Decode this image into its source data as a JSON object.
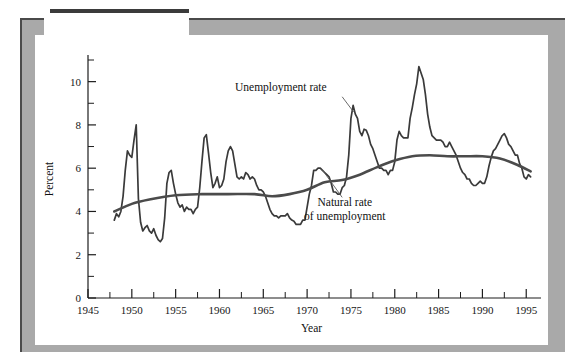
{
  "figure": {
    "label_prefix": "Figure ",
    "label_number": "5-1"
  },
  "chart_data": {
    "type": "line",
    "title": "",
    "xlabel": "Year",
    "ylabel": "Percent",
    "xlim": [
      1945,
      1996
    ],
    "ylim": [
      0,
      11
    ],
    "xticks": [
      1945,
      1950,
      1955,
      1960,
      1965,
      1970,
      1975,
      1980,
      1985,
      1990,
      1995
    ],
    "xtick_labels": [
      "1945",
      "1950",
      "1955",
      "1960",
      "1965",
      "1970",
      "1975",
      "1980",
      "1985",
      "1990",
      "1995"
    ],
    "x_minor_ticks": [
      1947.5,
      1952.5,
      1957.5,
      1962.5,
      1967.5,
      1972.5,
      1977.5,
      1982.5,
      1987.5,
      1992.5
    ],
    "yticks": [
      0,
      2,
      4,
      6,
      8,
      10
    ],
    "ytick_labels": [
      "0",
      "2",
      "4",
      "6",
      "8",
      "10"
    ],
    "y_minor_ticks": [
      1,
      3,
      5,
      7,
      9,
      11
    ],
    "grid": false,
    "legend_position": "annotations",
    "annotations": [
      {
        "name": "unemployment-rate",
        "text": "Unemployment rate",
        "text_x": 1967.0,
        "text_y": 9.55,
        "leader_from": [
          1974.0,
          9.3
        ],
        "leader_to": [
          1975.3,
          8.6
        ]
      },
      {
        "name": "natural-rate-of-unemployment",
        "text_line1": "Natural rate",
        "text_line2": "of unemployment",
        "text_x": 1974.3,
        "text_y": 4.25,
        "leader_from": [
          1974.0,
          4.65
        ],
        "leader_to": [
          1971.6,
          6.0
        ]
      }
    ],
    "series": [
      {
        "name": "Unemployment rate",
        "color": "#3a3a3a",
        "style": "jagged",
        "x": [
          1948.0,
          1948.25,
          1948.5,
          1948.75,
          1949.0,
          1949.25,
          1949.5,
          1949.75,
          1950.0,
          1950.25,
          1950.5,
          1950.75,
          1951.0,
          1951.25,
          1951.5,
          1951.75,
          1952.0,
          1952.25,
          1952.5,
          1952.75,
          1953.0,
          1953.25,
          1953.5,
          1953.75,
          1954.0,
          1954.25,
          1954.5,
          1954.75,
          1955.0,
          1955.25,
          1955.5,
          1955.75,
          1956.0,
          1956.25,
          1956.5,
          1956.75,
          1957.0,
          1957.25,
          1957.5,
          1957.75,
          1958.0,
          1958.25,
          1958.5,
          1958.75,
          1959.0,
          1959.25,
          1959.5,
          1959.75,
          1960.0,
          1960.25,
          1960.5,
          1960.75,
          1961.0,
          1961.25,
          1961.5,
          1961.75,
          1962.0,
          1962.25,
          1962.5,
          1962.75,
          1963.0,
          1963.25,
          1963.5,
          1963.75,
          1964.0,
          1964.25,
          1964.5,
          1964.75,
          1965.0,
          1965.25,
          1965.5,
          1965.75,
          1966.0,
          1966.25,
          1966.5,
          1966.75,
          1967.0,
          1967.25,
          1967.5,
          1967.75,
          1968.0,
          1968.25,
          1968.5,
          1968.75,
          1969.0,
          1969.25,
          1969.5,
          1969.75,
          1970.0,
          1970.25,
          1970.5,
          1970.75,
          1971.0,
          1971.25,
          1971.5,
          1971.75,
          1972.0,
          1972.25,
          1972.5,
          1972.75,
          1973.0,
          1973.25,
          1973.5,
          1973.75,
          1974.0,
          1974.25,
          1974.5,
          1974.75,
          1975.0,
          1975.25,
          1975.5,
          1975.75,
          1976.0,
          1976.25,
          1976.5,
          1976.75,
          1977.0,
          1977.25,
          1977.5,
          1977.75,
          1978.0,
          1978.25,
          1978.5,
          1978.75,
          1979.0,
          1979.25,
          1979.5,
          1979.75,
          1980.0,
          1980.25,
          1980.5,
          1980.75,
          1981.0,
          1981.25,
          1981.5,
          1981.75,
          1982.0,
          1982.25,
          1982.5,
          1982.75,
          1983.0,
          1983.25,
          1983.5,
          1983.75,
          1984.0,
          1984.25,
          1984.5,
          1984.75,
          1985.0,
          1985.25,
          1985.5,
          1985.75,
          1986.0,
          1986.25,
          1986.5,
          1986.75,
          1987.0,
          1987.25,
          1987.5,
          1987.75,
          1988.0,
          1988.25,
          1988.5,
          1988.75,
          1989.0,
          1989.25,
          1989.5,
          1989.75,
          1990.0,
          1990.25,
          1990.5,
          1990.75,
          1991.0,
          1991.25,
          1991.5,
          1991.75,
          1992.0,
          1992.25,
          1992.5,
          1992.75,
          1993.0,
          1993.25,
          1993.5,
          1993.75,
          1994.0,
          1994.25,
          1994.5,
          1994.75,
          1995.0,
          1995.25,
          1995.5
        ],
        "y": [
          3.6,
          3.9,
          3.75,
          4.0,
          4.7,
          5.9,
          6.8,
          6.6,
          6.5,
          7.3,
          8.0,
          4.6,
          3.5,
          3.1,
          3.25,
          3.35,
          3.1,
          3.0,
          3.2,
          2.9,
          2.7,
          2.6,
          2.75,
          3.7,
          5.3,
          5.8,
          5.9,
          5.3,
          4.8,
          4.4,
          4.2,
          4.3,
          4.0,
          4.2,
          4.1,
          4.1,
          3.9,
          4.1,
          4.2,
          5.1,
          6.3,
          7.4,
          7.55,
          6.7,
          5.8,
          5.1,
          5.3,
          5.6,
          5.1,
          5.2,
          5.5,
          6.3,
          6.8,
          7.0,
          6.8,
          6.2,
          5.6,
          5.5,
          5.6,
          5.5,
          5.8,
          5.7,
          5.5,
          5.6,
          5.5,
          5.2,
          5.0,
          5.0,
          4.9,
          4.7,
          4.4,
          4.1,
          3.9,
          3.8,
          3.8,
          3.7,
          3.8,
          3.8,
          3.8,
          3.9,
          3.7,
          3.6,
          3.55,
          3.4,
          3.4,
          3.4,
          3.6,
          3.6,
          4.2,
          4.8,
          5.2,
          5.9,
          5.9,
          6.0,
          6.0,
          5.9,
          5.8,
          5.7,
          5.6,
          5.3,
          4.9,
          4.9,
          4.8,
          4.8,
          5.1,
          5.2,
          5.6,
          6.6,
          8.3,
          8.9,
          8.5,
          8.3,
          7.7,
          7.5,
          7.8,
          7.75,
          7.5,
          7.1,
          6.9,
          6.6,
          6.3,
          6.0,
          6.0,
          5.9,
          5.9,
          5.7,
          5.9,
          5.9,
          6.3,
          7.3,
          7.7,
          7.5,
          7.4,
          7.4,
          7.4,
          8.3,
          8.8,
          9.4,
          9.9,
          10.7,
          10.4,
          10.1,
          9.4,
          8.5,
          7.9,
          7.5,
          7.4,
          7.3,
          7.3,
          7.3,
          7.2,
          7.0,
          7.0,
          7.2,
          7.0,
          6.8,
          6.6,
          6.3,
          6.0,
          5.8,
          5.7,
          5.5,
          5.5,
          5.3,
          5.2,
          5.2,
          5.3,
          5.4,
          5.3,
          5.3,
          5.6,
          6.1,
          6.5,
          6.8,
          6.9,
          7.1,
          7.3,
          7.5,
          7.6,
          7.4,
          7.1,
          7.0,
          6.8,
          6.6,
          6.6,
          6.2,
          6.0,
          5.6,
          5.5,
          5.7,
          5.6
        ]
      },
      {
        "name": "Natural rate of unemployment",
        "color": "#4b4b4b",
        "style": "smooth",
        "x": [
          1948,
          1950,
          1952,
          1955,
          1958,
          1961,
          1964,
          1966,
          1968,
          1970,
          1972,
          1974,
          1976,
          1978,
          1980,
          1982,
          1984,
          1986,
          1988,
          1990,
          1992,
          1994,
          1995.5
        ],
        "y": [
          4.0,
          4.35,
          4.55,
          4.75,
          4.8,
          4.8,
          4.8,
          4.7,
          4.8,
          5.0,
          5.35,
          5.45,
          5.7,
          6.05,
          6.35,
          6.55,
          6.6,
          6.55,
          6.55,
          6.55,
          6.45,
          6.15,
          5.85
        ]
      }
    ]
  }
}
